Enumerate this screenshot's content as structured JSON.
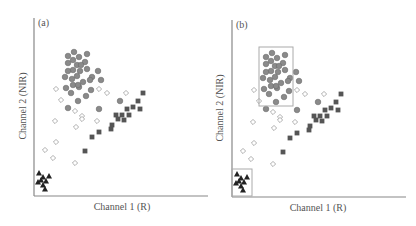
{
  "chart_data": [
    {
      "type": "scatter",
      "panel_label": "(a)",
      "xlabel": "Channel 1 (R)",
      "ylabel": "Channel 2 (NIR)",
      "grid": false,
      "legend": null,
      "axis_ticks": false,
      "series": [
        {
          "name": "circles",
          "marker": "circle",
          "color": "#8a8a8a",
          "points": [
            [
              74,
              52
            ],
            [
              68,
              56
            ],
            [
              79,
              57
            ],
            [
              87,
              54
            ],
            [
              73,
              60
            ],
            [
              68,
              63
            ],
            [
              85,
              62
            ],
            [
              77,
              65
            ],
            [
              81,
              65
            ],
            [
              73,
              70
            ],
            [
              68,
              71
            ],
            [
              87,
              69
            ],
            [
              98,
              71
            ],
            [
              80,
              71
            ],
            [
              65,
              77
            ],
            [
              72,
              79
            ],
            [
              77,
              76
            ],
            [
              83,
              82
            ],
            [
              92,
              77
            ],
            [
              90,
              80
            ],
            [
              101,
              80
            ],
            [
              73,
              85
            ],
            [
              79,
              87
            ],
            [
              78,
              85
            ],
            [
              66,
              88
            ],
            [
              71,
              93
            ],
            [
              91,
              90
            ],
            [
              86,
              96
            ],
            [
              78,
              101
            ],
            [
              68,
              108
            ],
            [
              99,
              109
            ],
            [
              120,
              101
            ]
          ]
        },
        {
          "name": "diamonds",
          "marker": "diamond",
          "color": "#ffffff",
          "points": [
            [
              56,
              89
            ],
            [
              61,
              100
            ],
            [
              75,
              111
            ],
            [
              82,
              116
            ],
            [
              82,
              119
            ],
            [
              55,
              121
            ],
            [
              76,
              127
            ],
            [
              97,
              121
            ],
            [
              99,
              89
            ],
            [
              107,
              93
            ],
            [
              126,
              93
            ],
            [
              56,
              142
            ],
            [
              45,
              150
            ],
            [
              53,
              158
            ],
            [
              75,
              163
            ]
          ]
        },
        {
          "name": "squares",
          "marker": "square",
          "color": "#555555",
          "points": [
            [
              143,
              93
            ],
            [
              138,
              101
            ],
            [
              133,
              107
            ],
            [
              140,
              109
            ],
            [
              127,
              109
            ],
            [
              116,
              115
            ],
            [
              122,
              115
            ],
            [
              129,
              115
            ],
            [
              118,
              119
            ],
            [
              124,
              120
            ],
            [
              112,
              125
            ],
            [
              111,
              129
            ],
            [
              99,
              132
            ],
            [
              92,
              137
            ],
            [
              85,
              151
            ]
          ]
        },
        {
          "name": "triangles",
          "marker": "triangle",
          "color": "#222222",
          "points": [
            [
              39,
              173
            ],
            [
              43,
              177
            ],
            [
              49,
              176
            ],
            [
              38,
              182
            ],
            [
              46,
              181
            ],
            [
              43,
              185
            ],
            [
              45,
              189
            ],
            [
              41,
              180
            ]
          ]
        }
      ],
      "highlight_boxes": []
    },
    {
      "type": "scatter",
      "panel_label": "(b)",
      "xlabel": "Channel 1 (R)",
      "ylabel": "Channel 2 (NIR)",
      "grid": false,
      "legend": null,
      "axis_ticks": false,
      "same_points_as": "(a)",
      "highlight_boxes": [
        {
          "target": "circles",
          "x": 259,
          "y": 47,
          "w": 34,
          "h": 59
        },
        {
          "target": "triangles",
          "x": 232,
          "y": 169,
          "w": 20,
          "h": 27
        }
      ]
    }
  ],
  "panels": [
    {
      "label": "(a)",
      "xlabel": "Channel 1 (R)",
      "ylabel": "Channel 2 (NIR)"
    },
    {
      "label": "(b)",
      "xlabel": "Channel 1 (R)",
      "ylabel": "Channel 2 (NIR)"
    }
  ],
  "colors": {
    "axis": "#888888",
    "circle_fill": "#8a8a8a",
    "circle_stroke": "#6a6a6a",
    "diamond_stroke": "#9a9a9a",
    "square_fill": "#555555",
    "triangle_fill": "#222222",
    "box_stroke": "#aaaaaa"
  }
}
